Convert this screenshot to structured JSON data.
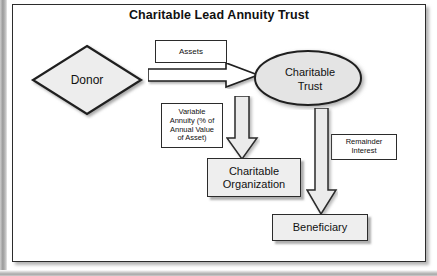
{
  "title": "Charitable Lead Annuity Trust",
  "nodes": {
    "donor": {
      "label": "Donor",
      "shape": "diamond"
    },
    "trust": {
      "label_line1": "Charitable",
      "label_line2": "Trust",
      "shape": "ellipse"
    },
    "charitable_organization": {
      "label_line1": "Charitable",
      "label_line2": "Organization",
      "shape": "rectangle"
    },
    "beneficiary": {
      "label": "Beneficiary",
      "shape": "rectangle"
    }
  },
  "labels": {
    "assets": "Assets",
    "annuity_line1": "Variable",
    "annuity_line2": "Annuity (% of",
    "annuity_line3": "Annual Value",
    "annuity_line4": "of Asset)",
    "remainder_line1": "Remainder",
    "remainder_line2": "Interest"
  },
  "arrows": [
    {
      "name": "assets-arrow",
      "from": "donor",
      "to": "trust",
      "direction": "right",
      "label": "Assets"
    },
    {
      "name": "annuity-arrow",
      "from": "trust",
      "to": "charitable_organization",
      "direction": "down",
      "label": "Variable Annuity (% of Annual Value of Asset)"
    },
    {
      "name": "remainder-arrow",
      "from": "trust",
      "to": "beneficiary",
      "direction": "down",
      "label": "Remainder Interest"
    }
  ],
  "colors": {
    "outline": "#2b2b2b",
    "shape_fill": "#e9e9e9",
    "box_fill": "#ffffff",
    "shaded_box_fill": "#eeeeee",
    "page_background": "#ffffff"
  }
}
